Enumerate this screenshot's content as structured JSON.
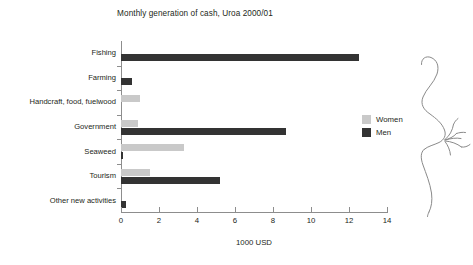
{
  "chart_data": {
    "type": "bar",
    "orientation": "horizontal",
    "title": "Monthly generation of cash, Uroa 2000/01",
    "xlabel": "1000 USD",
    "ylabel": "",
    "categories": [
      "Fishing",
      "Farming",
      "Handcraft, food, fuelwood",
      "Government",
      "Seaweed",
      "Tourism",
      "Other new activities"
    ],
    "series": [
      {
        "name": "Women",
        "color": "#c9c9c9",
        "values": [
          0,
          0,
          1.0,
          0.9,
          3.3,
          1.5,
          0
        ]
      },
      {
        "name": "Men",
        "color": "#333333",
        "values": [
          12.5,
          0.6,
          0,
          8.7,
          0.1,
          5.2,
          0.25
        ]
      }
    ],
    "xlim": [
      0,
      14
    ],
    "xticks": [
      0,
      2,
      4,
      6,
      8,
      10,
      12,
      14
    ],
    "xtick_labels": [
      "0",
      "2",
      "4",
      "6",
      "8",
      "10",
      "12",
      "14"
    ],
    "grid": false,
    "legend_position": "right"
  },
  "legend": {
    "entries": [
      {
        "label": "Women",
        "swatch": "legend-swatch-women"
      },
      {
        "label": "Men",
        "swatch": "legend-swatch-men"
      }
    ]
  },
  "decoration": {
    "name": "seaweed-sprig-drawing"
  }
}
